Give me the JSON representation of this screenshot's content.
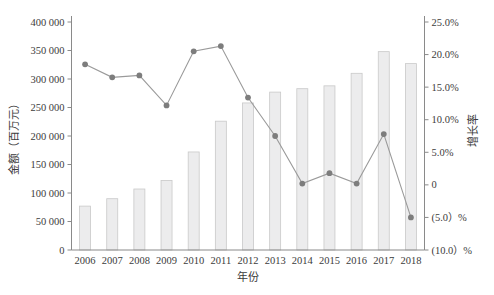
{
  "chart_data": {
    "type": "bar",
    "title": "",
    "subtitle": "",
    "xlabel": "年份",
    "ylabel": "金额（百万元）",
    "y2label": "增长率",
    "categories": [
      "2006",
      "2007",
      "2008",
      "2009",
      "2010",
      "2011",
      "2012",
      "2013",
      "2014",
      "2015",
      "2016",
      "2017",
      "2018"
    ],
    "ylim": [
      0,
      400000
    ],
    "y2lim": [
      -10,
      25
    ],
    "grid": false,
    "legend_position": "none",
    "y_ticks": [
      "0",
      "50 000",
      "100 000",
      "150 000",
      "200 000",
      "250 000",
      "300 000",
      "350 000",
      "400 000"
    ],
    "y_tick_values": [
      0,
      50000,
      100000,
      150000,
      200000,
      250000,
      300000,
      350000,
      400000
    ],
    "y2_ticks": [
      "(10.0）%",
      "(5.0）%",
      "0",
      "5.0%",
      "10.0%",
      "15.0%",
      "20.0%",
      "25.0%"
    ],
    "y2_tick_values": [
      -10,
      -5,
      0,
      5,
      10,
      15,
      20,
      25
    ],
    "series": [
      {
        "name": "金额（百万元）",
        "type": "bar",
        "axis": "left",
        "color": "#ececed",
        "edge_color": "#c9c9c9",
        "values": [
          77000,
          90000,
          107000,
          122000,
          172000,
          226000,
          258000,
          277000,
          283000,
          288000,
          310000,
          348000,
          327000
        ]
      },
      {
        "name": "增长率",
        "type": "line",
        "axis": "right",
        "color": "#9a9a9a",
        "marker_color": "#7d7d7d",
        "values": [
          18.5,
          16.5,
          16.8,
          12.2,
          20.5,
          21.3,
          13.4,
          7.5,
          0.2,
          1.8,
          0.2,
          7.8,
          -5.0
        ]
      }
    ],
    "caption": ""
  },
  "axes": {
    "left_title": "金额（百万元）",
    "right_title": "增长率",
    "x_title": "年份"
  }
}
